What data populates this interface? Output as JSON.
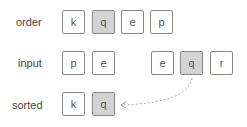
{
  "labels": {
    "order": "order",
    "input": "input",
    "sorted": "sorted"
  },
  "order": [
    "k",
    "q",
    "e",
    "p"
  ],
  "input_left": [
    "p",
    "e"
  ],
  "input_right": [
    "e",
    "q",
    "r"
  ],
  "sorted": [
    "k",
    "q"
  ],
  "colors": {
    "highlight": "#d3d3d3",
    "border": "#888888",
    "arrow": "#aaaaaa"
  }
}
